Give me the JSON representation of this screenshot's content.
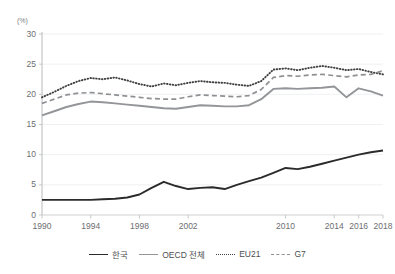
{
  "chart_data": {
    "type": "line",
    "title": "",
    "unit_label": "(%)",
    "xlabel": "",
    "ylabel": "",
    "ylim": [
      0,
      30
    ],
    "yticks": [
      0,
      5,
      10,
      15,
      20,
      25,
      30
    ],
    "xticks": [
      "1990",
      "1994",
      "1998",
      "2002",
      "2010",
      "2014",
      "2016",
      "2018"
    ],
    "xtick_years": [
      1990,
      1994,
      1998,
      2002,
      2010,
      2014,
      2016,
      2018
    ],
    "grid": true,
    "legend_position": "bottom",
    "x": [
      1990,
      1991,
      1992,
      1993,
      1994,
      1995,
      1996,
      1997,
      1998,
      1999,
      2000,
      2001,
      2002,
      2003,
      2004,
      2005,
      2006,
      2007,
      2008,
      2009,
      2010,
      2011,
      2012,
      2013,
      2014,
      2015,
      2016,
      2017,
      2018
    ],
    "series": [
      {
        "name": "한국",
        "style": "solid",
        "color": "#2b2b2b",
        "values": [
          2.5,
          2.5,
          2.5,
          2.5,
          2.5,
          2.6,
          2.7,
          2.9,
          3.4,
          4.5,
          5.5,
          4.8,
          4.3,
          4.5,
          4.6,
          4.3,
          5.0,
          5.6,
          6.2,
          7.0,
          7.8,
          7.6,
          8.0,
          8.5,
          9.0,
          9.5,
          10.0,
          10.4,
          10.7
        ]
      },
      {
        "name": "OECD 전체",
        "style": "solid",
        "color": "#939598",
        "values": [
          16.5,
          17.2,
          17.9,
          18.4,
          18.8,
          18.7,
          18.5,
          18.3,
          18.1,
          17.9,
          17.7,
          17.6,
          17.9,
          18.2,
          18.1,
          18.0,
          18.0,
          18.2,
          19.2,
          20.9,
          21.0,
          20.9,
          21.0,
          21.1,
          21.3,
          19.5,
          21.0,
          20.5,
          19.8
        ]
      },
      {
        "name": "EU21",
        "style": "dotted",
        "color": "#404040",
        "values": [
          19.5,
          20.4,
          21.4,
          22.2,
          22.7,
          22.5,
          22.8,
          22.3,
          21.7,
          21.3,
          21.8,
          21.5,
          21.9,
          22.2,
          22.0,
          21.9,
          21.6,
          21.4,
          22.2,
          24.1,
          24.3,
          24.0,
          24.4,
          24.7,
          24.4,
          24.0,
          24.2,
          23.7,
          23.3
        ]
      },
      {
        "name": "G7",
        "style": "dashed",
        "color": "#8e9093",
        "values": [
          18.5,
          19.2,
          19.9,
          20.2,
          20.3,
          20.1,
          19.9,
          19.7,
          19.5,
          19.3,
          19.2,
          19.2,
          19.6,
          19.9,
          19.8,
          19.7,
          19.6,
          19.8,
          20.8,
          22.8,
          23.1,
          23.0,
          23.2,
          23.3,
          23.1,
          22.9,
          23.2,
          23.3,
          23.9
        ]
      }
    ]
  },
  "legend": {
    "items": [
      {
        "label": "한국",
        "style": "solid-dark"
      },
      {
        "label": "OECD 전체",
        "style": "solid-gray"
      },
      {
        "label": "EU21",
        "style": "dotted"
      },
      {
        "label": "G7",
        "style": "dashed"
      }
    ]
  }
}
